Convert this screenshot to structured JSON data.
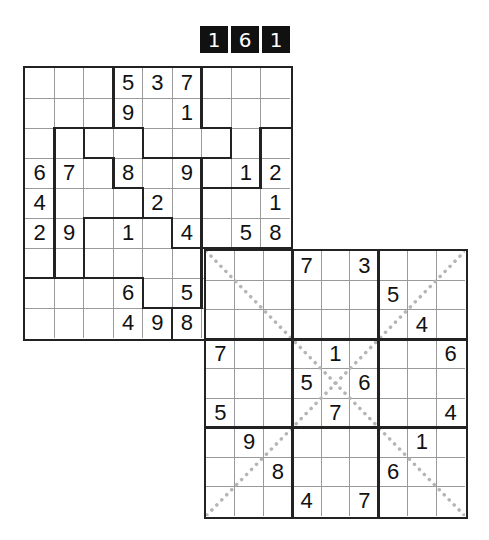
{
  "puzzle_number": {
    "digits": [
      "1",
      "6",
      "1"
    ]
  },
  "grids": [
    {
      "name": "grid-1-jigsaw",
      "x": 23,
      "y": 66,
      "width": 270,
      "height": 275,
      "values": [
        [
          "",
          "",
          "",
          "5",
          "3",
          "7",
          "",
          "",
          ""
        ],
        [
          "",
          "",
          "",
          "9",
          "",
          "1",
          "",
          "",
          ""
        ],
        [
          "",
          "",
          "",
          "",
          "",
          "",
          "",
          "",
          ""
        ],
        [
          "6",
          "7",
          "",
          "8",
          "",
          "9",
          "",
          "1",
          "2"
        ],
        [
          "4",
          "",
          "",
          "",
          "2",
          "",
          "",
          "",
          "1"
        ],
        [
          "2",
          "9",
          "",
          "1",
          "",
          "4",
          "",
          "5",
          "8"
        ],
        [
          "",
          "",
          "",
          "",
          "",
          "",
          "",
          "",
          ""
        ],
        [
          "",
          "",
          "",
          "6",
          "",
          "5",
          "",
          "",
          ""
        ],
        [
          "",
          "",
          "",
          "4",
          "9",
          "8",
          "",
          "",
          ""
        ]
      ],
      "regions": [
        [
          0,
          0,
          0,
          1,
          1,
          1,
          2,
          2,
          2
        ],
        [
          0,
          0,
          0,
          1,
          1,
          1,
          2,
          2,
          2
        ],
        [
          0,
          3,
          4,
          4,
          1,
          1,
          1,
          2,
          5
        ],
        [
          0,
          3,
          3,
          4,
          4,
          4,
          2,
          2,
          5
        ],
        [
          0,
          3,
          3,
          3,
          4,
          4,
          5,
          5,
          5
        ],
        [
          0,
          3,
          6,
          6,
          6,
          4,
          5,
          5,
          5
        ],
        [
          0,
          3,
          6,
          6,
          6,
          6,
          7,
          7,
          7
        ],
        [
          8,
          8,
          8,
          8,
          6,
          6,
          7,
          7,
          7
        ],
        [
          8,
          8,
          8,
          8,
          8,
          7,
          7,
          7,
          7
        ]
      ],
      "diagonals": false
    },
    {
      "name": "grid-2-x-sudoku",
      "x": 204,
      "y": 249,
      "width": 264,
      "height": 270,
      "values": [
        [
          "",
          "",
          "",
          "7",
          "",
          "3",
          "",
          "",
          ""
        ],
        [
          "",
          "",
          "",
          "",
          "",
          "",
          "5",
          "",
          ""
        ],
        [
          "",
          "",
          "",
          "",
          "",
          "",
          "",
          "4",
          ""
        ],
        [
          "7",
          "",
          "",
          "",
          "1",
          "",
          "",
          "",
          "6"
        ],
        [
          "",
          "",
          "",
          "5",
          "",
          "6",
          "",
          "",
          ""
        ],
        [
          "5",
          "",
          "",
          "",
          "7",
          "",
          "",
          "",
          "4"
        ],
        [
          "",
          "9",
          "",
          "",
          "",
          "",
          "",
          "1",
          ""
        ],
        [
          "",
          "",
          "8",
          "",
          "",
          "",
          "6",
          "",
          ""
        ],
        [
          "",
          "",
          "",
          "4",
          "",
          "7",
          "",
          "",
          ""
        ]
      ],
      "regions": [
        [
          0,
          0,
          0,
          1,
          1,
          1,
          2,
          2,
          2
        ],
        [
          0,
          0,
          0,
          1,
          1,
          1,
          2,
          2,
          2
        ],
        [
          0,
          0,
          0,
          1,
          1,
          1,
          2,
          2,
          2
        ],
        [
          3,
          3,
          3,
          4,
          4,
          4,
          5,
          5,
          5
        ],
        [
          3,
          3,
          3,
          4,
          4,
          4,
          5,
          5,
          5
        ],
        [
          3,
          3,
          3,
          4,
          4,
          4,
          5,
          5,
          5
        ],
        [
          6,
          6,
          6,
          7,
          7,
          7,
          8,
          8,
          8
        ],
        [
          6,
          6,
          6,
          7,
          7,
          7,
          8,
          8,
          8
        ],
        [
          6,
          6,
          6,
          7,
          7,
          7,
          8,
          8,
          8
        ]
      ],
      "diagonals": true
    }
  ],
  "colors": {
    "grid_line": "#9a9a9a",
    "region_line": "#222222",
    "diagonal": "#b5b5b5",
    "digit": "#111111",
    "counter_bg": "#111111",
    "counter_fg": "#ffffff"
  }
}
